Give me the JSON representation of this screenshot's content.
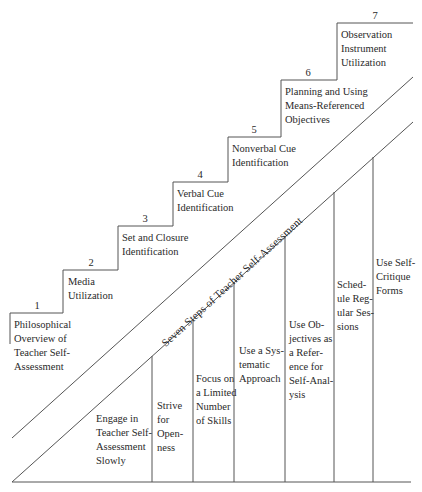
{
  "diagram": {
    "band_label": "Seven Steps of Teacher Self-Assessment",
    "steps": [
      {
        "number": "1",
        "lines": [
          "Philosophical",
          "Overview of",
          "Teacher Self-",
          "Assessment"
        ]
      },
      {
        "number": "2",
        "lines": [
          "Media",
          "Utilization"
        ]
      },
      {
        "number": "3",
        "lines": [
          "Set and Closure",
          "Identification"
        ]
      },
      {
        "number": "4",
        "lines": [
          "Verbal Cue",
          "Identification"
        ]
      },
      {
        "number": "5",
        "lines": [
          "Nonverbal Cue",
          "Identification"
        ]
      },
      {
        "number": "6",
        "lines": [
          "Planning and Using",
          "Means-Referenced",
          "Objectives"
        ]
      },
      {
        "number": "7",
        "lines": [
          "Observation",
          "Instrument",
          "Utilization"
        ]
      }
    ],
    "pillars": [
      {
        "lines": [
          "Engage in",
          "Teacher Self-",
          "Assessment",
          "Slowly"
        ]
      },
      {
        "lines": [
          "Strive",
          "for",
          "Open-",
          "ness"
        ]
      },
      {
        "lines": [
          "Focus on",
          "a Limited",
          "Number",
          "of Skills"
        ]
      },
      {
        "lines": [
          "Use a Sys-",
          "tematic",
          "Approach"
        ]
      },
      {
        "lines": [
          "Use Ob-",
          "jectives as",
          "a Refer-",
          "ence for",
          "Self-Anal-",
          "ysis"
        ]
      },
      {
        "lines": [
          "Sched-",
          "ule Reg-",
          "ular Ses-",
          "sions"
        ]
      },
      {
        "lines": [
          "Use Self-",
          "Critique",
          "Forms"
        ]
      }
    ],
    "line_color": "#555555"
  }
}
